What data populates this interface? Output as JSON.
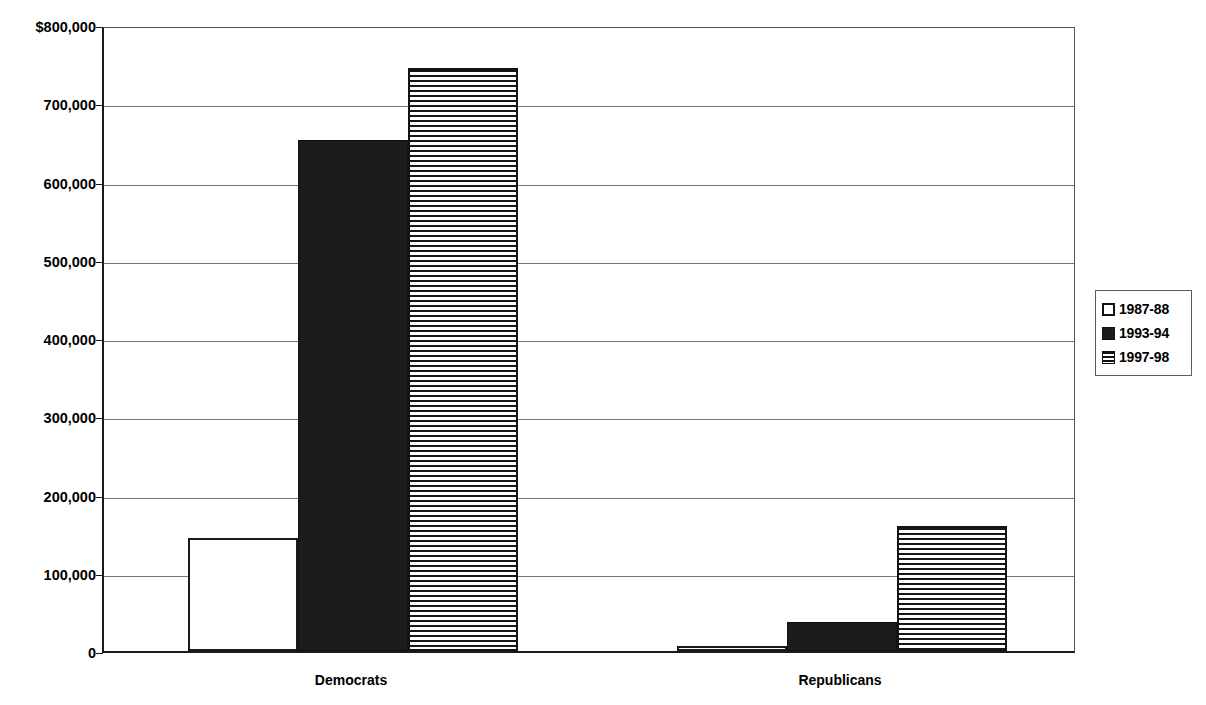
{
  "chart_data": {
    "type": "bar",
    "title": "",
    "subtitle": "",
    "xlabel": "",
    "ylabel": "",
    "categories": [
      "Democrats",
      "Republicans"
    ],
    "series": [
      {
        "name": "1987-88",
        "pattern": "empty",
        "values": [
          144000,
          7000
        ]
      },
      {
        "name": "1993-94",
        "pattern": "solid",
        "values": [
          653000,
          37000
        ]
      },
      {
        "name": "1997-98",
        "pattern": "striped",
        "values": [
          745000,
          160000
        ]
      }
    ],
    "ylim": [
      0,
      800000
    ],
    "ytick_values": [
      800000,
      700000,
      600000,
      500000,
      400000,
      300000,
      200000,
      100000,
      0
    ],
    "ytick_labels": [
      "$800,000",
      "700,000",
      "600,000",
      "500,000",
      "400,000",
      "300,000",
      "200,000",
      "100,000",
      "0"
    ],
    "grid": true,
    "legend_position": "right",
    "colors": {
      "ink": "#1a1a1a",
      "gridline": "#767676",
      "solid_fill": "#1c1c1c",
      "empty_fill": "#ffffff",
      "background": "#ffffff"
    }
  },
  "legend": {
    "entries": [
      {
        "label": "1987-88",
        "pattern": "empty"
      },
      {
        "label": "1993-94",
        "pattern": "solid"
      },
      {
        "label": "1997-98",
        "pattern": "striped"
      }
    ]
  }
}
